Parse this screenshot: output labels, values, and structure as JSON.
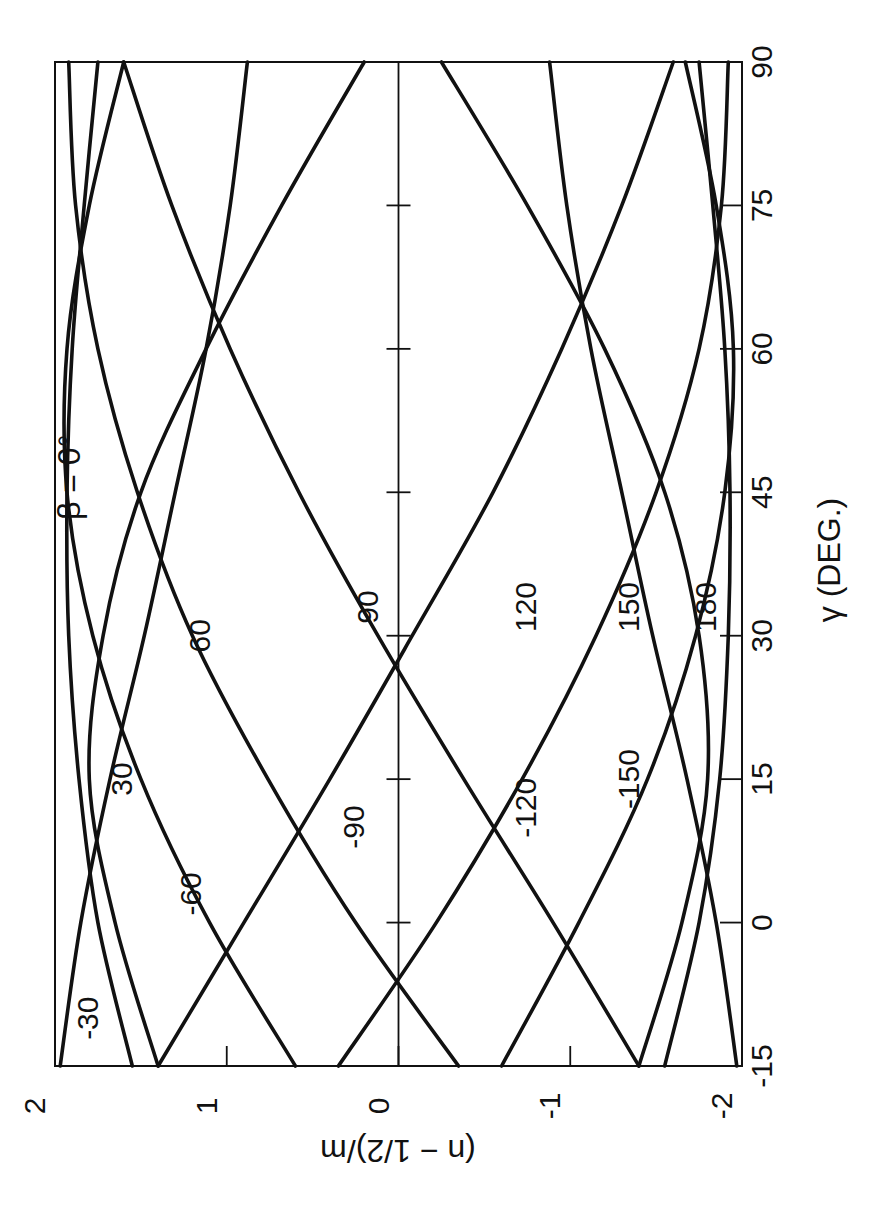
{
  "chart_data": {
    "type": "line",
    "orientation": "rotated 90 degrees counter-clockwise (x-axis runs vertically on the right, y-axis runs horizontally at the bottom)",
    "title": "",
    "annotation": "β = 0°",
    "xlabel": "γ (DEG.)",
    "ylabel": "(n − 1/2)/m",
    "xlim": [
      -15,
      90
    ],
    "ylim": [
      -2,
      2
    ],
    "x_ticks": [
      -15,
      0,
      15,
      30,
      45,
      60,
      75,
      90
    ],
    "x_tick_labels": [
      "-15",
      "0",
      "15",
      "30",
      "45",
      "60",
      "75",
      "90"
    ],
    "y_ticks": [
      -2,
      -1,
      0,
      1,
      2
    ],
    "y_tick_labels": [
      "-2",
      "-1",
      "0",
      "1",
      "2"
    ],
    "grid": false,
    "zero_line": true,
    "legend": "none (curves labeled inline)",
    "series": [
      {
        "name": "-30",
        "x": [
          -15,
          0,
          15,
          30,
          45,
          60,
          75,
          90
        ],
        "y": [
          1.97,
          1.85,
          1.68,
          1.48,
          1.3,
          1.12,
          0.98,
          0.88
        ]
      },
      {
        "name": "30",
        "x": [
          -15,
          0,
          15,
          30,
          45,
          60,
          75,
          90
        ],
        "y": [
          1.55,
          1.75,
          1.86,
          1.92,
          1.93,
          1.9,
          1.83,
          1.75
        ]
      },
      {
        "name": "-60",
        "x": [
          -15,
          0,
          15,
          30,
          45,
          60,
          75,
          90
        ],
        "y": [
          1.4,
          0.9,
          0.4,
          -0.08,
          -0.55,
          -0.95,
          -1.3,
          -1.6
        ]
      },
      {
        "name": "60",
        "x": [
          -15,
          0,
          15,
          30,
          45,
          60,
          75,
          90
        ],
        "y": [
          1.4,
          1.65,
          1.8,
          1.72,
          1.5,
          1.12,
          0.68,
          0.2
        ]
      },
      {
        "name": "-90",
        "x": [
          -15,
          0,
          15,
          30,
          45,
          60,
          75,
          90
        ],
        "y": [
          0.35,
          -0.22,
          -0.72,
          -1.15,
          -1.5,
          -1.75,
          -1.88,
          -1.92
        ]
      },
      {
        "name": "90",
        "x": [
          -15,
          0,
          15,
          30,
          45,
          60,
          75,
          90
        ],
        "y": [
          0.6,
          1.1,
          1.5,
          1.78,
          1.93,
          1.93,
          1.8,
          1.6
        ]
      },
      {
        "name": "-120",
        "x": [
          -15,
          0,
          15,
          30,
          45,
          60,
          75,
          90
        ],
        "y": [
          -0.6,
          -1.05,
          -1.45,
          -1.73,
          -1.9,
          -1.95,
          -1.85,
          -1.67
        ]
      },
      {
        "name": "120",
        "x": [
          -15,
          0,
          15,
          30,
          45,
          60,
          75,
          90
        ],
        "y": [
          -0.35,
          0.25,
          0.76,
          1.2,
          1.52,
          1.75,
          1.88,
          1.92
        ]
      },
      {
        "name": "-150",
        "x": [
          -15,
          0,
          15,
          30,
          45,
          60,
          75,
          90
        ],
        "y": [
          -1.4,
          -1.65,
          -1.8,
          -1.75,
          -1.55,
          -1.2,
          -0.75,
          -0.25
        ]
      },
      {
        "name": "150",
        "x": [
          -15,
          0,
          15,
          30,
          45,
          60,
          75,
          90
        ],
        "y": [
          -1.4,
          -0.9,
          -0.38,
          0.12,
          0.58,
          0.98,
          1.32,
          1.6
        ]
      },
      {
        "name": "180",
        "x": [
          -15,
          0,
          15,
          30,
          45,
          60,
          75,
          90
        ],
        "y": [
          -1.55,
          -1.75,
          -1.87,
          -1.92,
          -1.93,
          -1.9,
          -1.83,
          -1.75
        ]
      },
      {
        "name": "-180b",
        "x": [
          -15,
          0,
          15,
          30,
          45,
          60,
          75,
          90
        ],
        "y": [
          -1.97,
          -1.85,
          -1.68,
          -1.48,
          -1.3,
          -1.12,
          -0.98,
          -0.88
        ]
      }
    ]
  },
  "labels": {
    "beta": "β = 0°",
    "xlabel": "γ (DEG.)",
    "ylabel": "(n − 1/2)/m"
  },
  "curve_labels": [
    {
      "text": "-30",
      "x": -10,
      "y": 1.75
    },
    {
      "text": "30",
      "x": 15,
      "y": 1.55
    },
    {
      "text": "-60",
      "x": 3,
      "y": 1.15
    },
    {
      "text": "60",
      "x": 30,
      "y": 1.1
    },
    {
      "text": "-90",
      "x": 10,
      "y": 0.2
    },
    {
      "text": "90",
      "x": 33,
      "y": 0.12
    },
    {
      "text": "-120",
      "x": 12,
      "y": -0.8
    },
    {
      "text": "120",
      "x": 33,
      "y": -0.8
    },
    {
      "text": "-150",
      "x": 15,
      "y": -1.4
    },
    {
      "text": "150",
      "x": 33,
      "y": -1.4
    },
    {
      "text": "180",
      "x": 33,
      "y": -1.85
    }
  ]
}
